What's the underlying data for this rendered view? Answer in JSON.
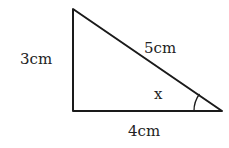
{
  "diagram": {
    "type": "right-triangle",
    "sides": {
      "vertical": "3cm",
      "hypotenuse": "5cm",
      "horizontal": "4cm"
    },
    "angle_label": "x",
    "colors": {
      "stroke": "#1a1a1a",
      "background": "#ffffff"
    }
  }
}
